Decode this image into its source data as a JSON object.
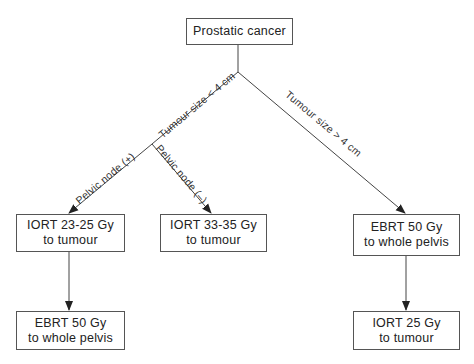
{
  "diagram": {
    "type": "flowchart",
    "nodes": [
      {
        "id": "root",
        "lines": [
          "Prostatic cancer"
        ]
      },
      {
        "id": "iort_23_25",
        "lines": [
          "IORT 23-25 Gy",
          "to tumour"
        ]
      },
      {
        "id": "iort_33_35",
        "lines": [
          "IORT 33-35 Gy",
          "to tumour"
        ]
      },
      {
        "id": "ebrt_50_right",
        "lines": [
          "EBRT 50 Gy",
          "to whole pelvis"
        ]
      },
      {
        "id": "ebrt_50_left",
        "lines": [
          "EBRT 50 Gy",
          "to whole pelvis"
        ]
      },
      {
        "id": "iort_25",
        "lines": [
          "IORT 25 Gy",
          "to tumour"
        ]
      }
    ],
    "edges": [
      {
        "from": "root",
        "to": "branch_small",
        "label": "Tumour size < 4 cm"
      },
      {
        "from": "root",
        "to": "ebrt_50_right",
        "label": "Tumour size > 4 cm"
      },
      {
        "from": "branch_small",
        "to": "iort_23_25",
        "label": "Pelvic node (+)"
      },
      {
        "from": "branch_small",
        "to": "iort_33_35",
        "label": "Pelvic node (–)"
      },
      {
        "from": "iort_23_25",
        "to": "ebrt_50_left",
        "label": ""
      },
      {
        "from": "ebrt_50_right",
        "to": "iort_25",
        "label": ""
      }
    ],
    "edge_labels": {
      "small": "Tumour size < 4 cm",
      "large": "Tumour size > 4 cm",
      "node_pos": "Pelvic node (+)",
      "node_neg": "Pelvic node (–)"
    },
    "colors": {
      "line": "#444444",
      "border": "#555555",
      "text": "#222222",
      "background": "#ffffff"
    }
  }
}
